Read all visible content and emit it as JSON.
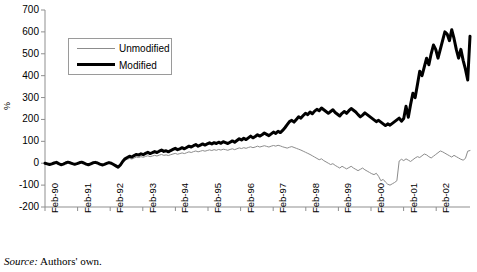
{
  "source_note": {
    "label": "Source:",
    "text": "Authors' own."
  },
  "legend": {
    "position": "inside-top-left",
    "entries": [
      {
        "name": "Unmodified",
        "style": "thin",
        "color": "#8c8c8c"
      },
      {
        "name": "Modified",
        "style": "bold",
        "color": "#000000"
      }
    ]
  },
  "chart_data": {
    "type": "line",
    "title": "",
    "subtitle": "",
    "xlabel": "",
    "ylabel": "%",
    "grid": false,
    "legend_position": "inside-top-left",
    "ylim": [
      -200,
      700
    ],
    "yticks": [
      700,
      600,
      500,
      400,
      300,
      200,
      100,
      0,
      -100,
      -200
    ],
    "ytick_labels": [
      "700",
      "600",
      "500",
      "400",
      "300",
      "200",
      "100",
      "0",
      "-100",
      "-200"
    ],
    "xtick_labels": [
      "Feb-90",
      "Feb-91",
      "Feb-92",
      "Feb-93",
      "Feb-94",
      "Feb-95",
      "Feb-96",
      "Feb-97",
      "Feb-98",
      "Feb-99",
      "Feb-00",
      "Feb-01",
      "Feb-02"
    ],
    "x_unit": "month",
    "x_start": "Feb-90",
    "x_end": "Dec-02",
    "series": [
      {
        "name": "Unmodified",
        "color": "#8c8c8c",
        "width": 1,
        "values": [
          0,
          -2,
          -4,
          -2,
          0,
          2,
          -2,
          -5,
          -3,
          0,
          3,
          1,
          -2,
          -4,
          -2,
          1,
          3,
          0,
          -3,
          -5,
          -2,
          1,
          2,
          0,
          -3,
          -6,
          -4,
          -1,
          2,
          0,
          -4,
          -8,
          -12,
          -6,
          5,
          14,
          18,
          22,
          19,
          24,
          28,
          26,
          30,
          27,
          31,
          34,
          30,
          33,
          36,
          33,
          37,
          40,
          36,
          38,
          35,
          39,
          42,
          45,
          41,
          44,
          47,
          44,
          48,
          52,
          49,
          53,
          56,
          52,
          55,
          58,
          55,
          58,
          61,
          58,
          62,
          59,
          63,
          60,
          64,
          62,
          59,
          63,
          66,
          62,
          66,
          70,
          67,
          71,
          68,
          72,
          75,
          71,
          74,
          78,
          74,
          77,
          80,
          77,
          74,
          78,
          81,
          78,
          82,
          79,
          75,
          72,
          69,
          73,
          76,
          72,
          68,
          64,
          60,
          55,
          50,
          45,
          40,
          34,
          28,
          22,
          16,
          20,
          12,
          6,
          0,
          -6,
          -2,
          -10,
          -16,
          -22,
          -14,
          -20,
          -26,
          -20,
          -14,
          -22,
          -28,
          -34,
          -28,
          -22,
          -30,
          -36,
          -42,
          -48,
          -52,
          -46,
          -60,
          -80,
          -74,
          -86,
          -96,
          -100,
          -94,
          -88,
          -80,
          10,
          18,
          12,
          20,
          14,
          8,
          16,
          24,
          30,
          26,
          34,
          42,
          38,
          30,
          24,
          32,
          40,
          48,
          56,
          52,
          46,
          40,
          34,
          28,
          36,
          30,
          24,
          18,
          14,
          22,
          55,
          58
        ]
      },
      {
        "name": "Modified",
        "color": "#000000",
        "width": 3,
        "values": [
          0,
          -3,
          -6,
          -3,
          1,
          4,
          -2,
          -7,
          -4,
          1,
          5,
          2,
          -2,
          -5,
          -2,
          2,
          5,
          1,
          -4,
          -7,
          -3,
          2,
          4,
          1,
          -4,
          -8,
          -5,
          -1,
          3,
          0,
          -6,
          -12,
          -18,
          -8,
          8,
          20,
          26,
          32,
          28,
          35,
          40,
          37,
          43,
          39,
          45,
          50,
          44,
          48,
          53,
          49,
          55,
          60,
          54,
          57,
          52,
          58,
          63,
          68,
          62,
          66,
          71,
          66,
          72,
          78,
          74,
          80,
          85,
          78,
          83,
          88,
          83,
          88,
          93,
          88,
          94,
          90,
          96,
          91,
          98,
          94,
          90,
          96,
          102,
          96,
          104,
          112,
          106,
          114,
          108,
          116,
          124,
          116,
          122,
          130,
          124,
          130,
          138,
          132,
          126,
          134,
          142,
          136,
          146,
          140,
          150,
          162,
          176,
          190,
          196,
          188,
          200,
          212,
          206,
          218,
          228,
          222,
          234,
          226,
          238,
          246,
          240,
          252,
          244,
          236,
          228,
          236,
          244,
          232,
          224,
          216,
          228,
          236,
          228,
          240,
          250,
          242,
          234,
          222,
          212,
          220,
          230,
          222,
          214,
          206,
          198,
          190,
          196,
          188,
          180,
          172,
          180,
          174,
          182,
          190,
          198,
          206,
          192,
          204,
          260,
          210,
          268,
          320,
          300,
          360,
          420,
          400,
          440,
          480,
          450,
          500,
          540,
          520,
          480,
          520,
          560,
          600,
          590,
          560,
          610,
          570,
          520,
          480,
          520,
          470,
          430,
          380,
          580
        ]
      }
    ],
    "annotations": []
  }
}
